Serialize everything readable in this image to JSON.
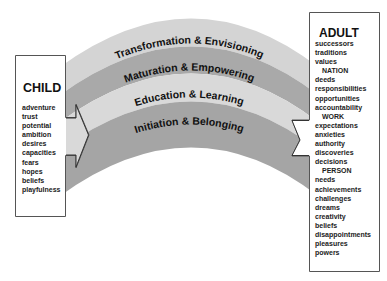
{
  "bands": [
    {
      "label": "Transformation & Envisioning",
      "color": "#d4d4d4"
    },
    {
      "label": "Maturation & Empowering",
      "color": "#a9a9a9"
    },
    {
      "label": "Education & Learning",
      "color": "#d9d9d9"
    },
    {
      "label": "Initiation & Belonging",
      "color": "#a5a5a5"
    }
  ],
  "child": {
    "title": "CHILD",
    "items": [
      "adventure",
      "trust",
      "potential",
      "ambition",
      "desires",
      "capacities",
      "fears",
      "hopes",
      "beliefs",
      "playfulness"
    ]
  },
  "adult": {
    "title": "ADULT",
    "items": [
      {
        "text": "successors",
        "sub": false
      },
      {
        "text": "traditions",
        "sub": false
      },
      {
        "text": "values",
        "sub": false
      },
      {
        "text": "NATION",
        "sub": true
      },
      {
        "text": "deeds",
        "sub": false
      },
      {
        "text": "responsibilities",
        "sub": false
      },
      {
        "text": "opportunities",
        "sub": false
      },
      {
        "text": "accountability",
        "sub": false
      },
      {
        "text": "WORK",
        "sub": true
      },
      {
        "text": "expectations",
        "sub": false
      },
      {
        "text": "anxieties",
        "sub": false
      },
      {
        "text": "authority",
        "sub": false
      },
      {
        "text": "discoveries",
        "sub": false
      },
      {
        "text": "decisions",
        "sub": false
      },
      {
        "text": "PERSON",
        "sub": true
      },
      {
        "text": "needs",
        "sub": false
      },
      {
        "text": "achievements",
        "sub": false
      },
      {
        "text": "challenges",
        "sub": false
      },
      {
        "text": "dreams",
        "sub": false
      },
      {
        "text": "creativity",
        "sub": false
      },
      {
        "text": "beliefs",
        "sub": false
      },
      {
        "text": "disappointments",
        "sub": false
      },
      {
        "text": "pleasures",
        "sub": false
      },
      {
        "text": "powers",
        "sub": false
      }
    ]
  }
}
